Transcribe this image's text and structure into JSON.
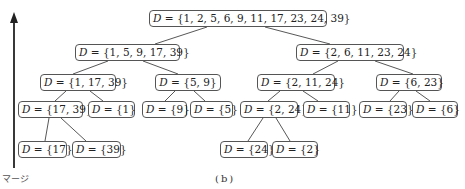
{
  "diagram": {
    "type": "merge-sort-tree",
    "caption": "(b)",
    "axis_label": "マージ",
    "axis_direction": "up",
    "prefix": "D = ",
    "nodes": {
      "root": "{1, 2, 5, 6, 9, 11, 17, 23, 24, 39}",
      "l": "{1, 5, 9, 17, 39}",
      "r": "{2, 6, 11, 23, 24}",
      "ll": "{1, 17, 39}",
      "lr": "{5, 9}",
      "rl": "{2, 11, 24}",
      "rr": "{6, 23}",
      "lll": "{17, 39}",
      "llr": "{1}",
      "lrl": "{9}",
      "lrr": "{5}",
      "rll": "{2, 24}",
      "rlr": "{11}",
      "rrl": "{23}",
      "rrr": "{6}",
      "llll": "{17}",
      "lllr": "{39}",
      "rlll": "{24}",
      "rllr": "{2}"
    }
  }
}
